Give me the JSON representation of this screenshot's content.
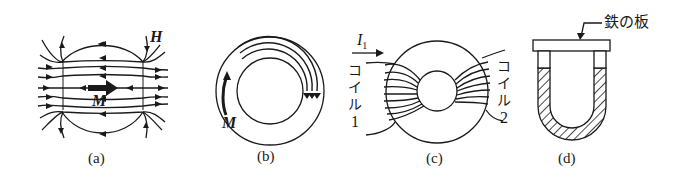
{
  "figure": {
    "panels": [
      {
        "id": "a",
        "label": "(a)",
        "description": "bar magnet with field lines",
        "symbols": {
          "field": "H",
          "magnetization": "M"
        }
      },
      {
        "id": "b",
        "label": "(b)",
        "description": "closed ring magnetized circumferentially",
        "symbols": {
          "magnetization": "M"
        }
      },
      {
        "id": "c",
        "label": "(c)",
        "description": "toroid with two coils",
        "symbols": {
          "current": "I",
          "current_sub": "1"
        },
        "coil1": {
          "chars": [
            "コ",
            "イ",
            "ル",
            "1"
          ]
        },
        "coil2": {
          "chars": [
            "コ",
            "イ",
            "ル",
            "2"
          ]
        }
      },
      {
        "id": "d",
        "label": "(d)",
        "description": "U-shaped magnet with iron plate keeper",
        "callout": "鉄の板"
      }
    ],
    "colors": {
      "ink": "#1a1a1a",
      "background": "#ffffff"
    }
  }
}
